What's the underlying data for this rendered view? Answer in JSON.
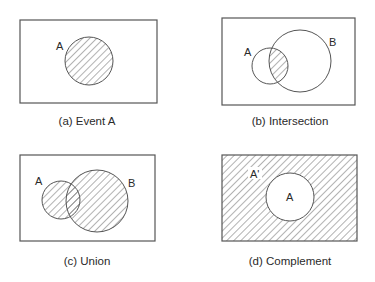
{
  "figure": {
    "type": "venn-diagram-set",
    "panels": [
      {
        "id": "a",
        "caption": "(a) Event A",
        "labels": [
          "A"
        ],
        "shaded": "A"
      },
      {
        "id": "b",
        "caption": "(b) Intersection",
        "labels": [
          "A",
          "B"
        ],
        "shaded": "A ∩ B"
      },
      {
        "id": "c",
        "caption": "(c) Union",
        "labels": [
          "A",
          "B"
        ],
        "shaded": "A ∪ B"
      },
      {
        "id": "d",
        "caption": "(d) Complement",
        "labels": [
          "A'",
          "A"
        ],
        "shaded": "A'"
      }
    ],
    "colors": {
      "stroke": "#555555",
      "hatch": "#555555",
      "background": "#ffffff"
    }
  }
}
